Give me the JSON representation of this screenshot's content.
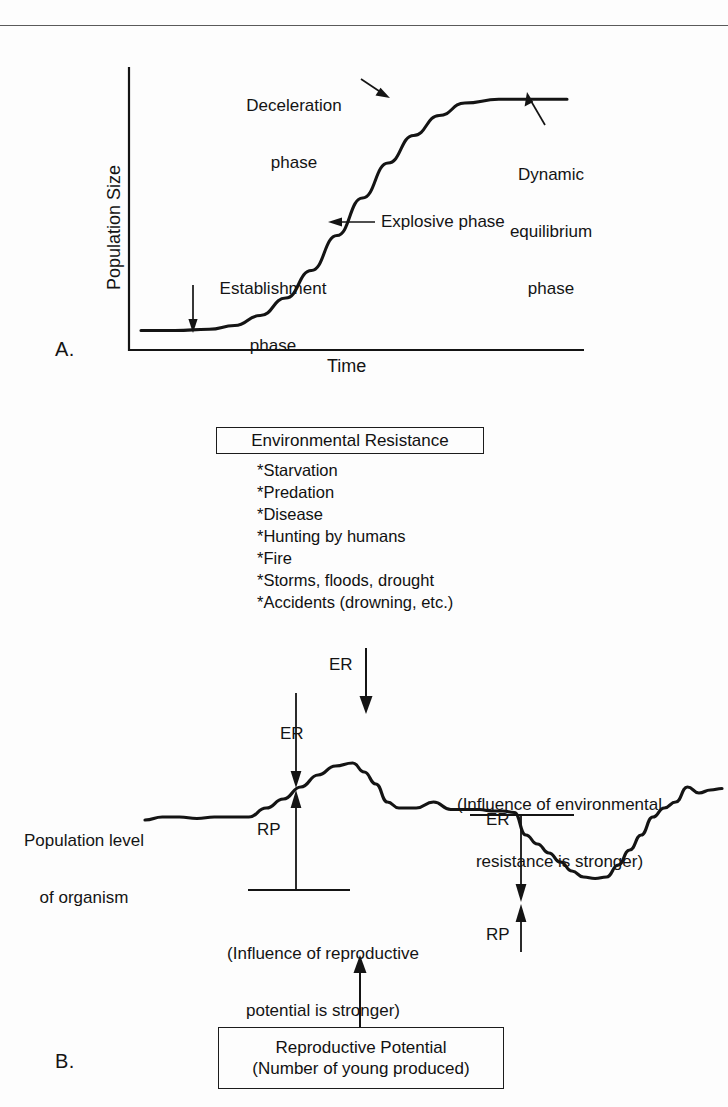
{
  "figure": {
    "panel_a_letter": "A.",
    "panel_b_letter": "B."
  },
  "chart_data": {
    "type": "line",
    "title": "",
    "panels": [
      {
        "id": "A",
        "type": "line",
        "xlabel": "Time",
        "ylabel": "Population Size",
        "description": "Sigmoid (logistic) population growth curve",
        "grid": false,
        "legend": "none",
        "xlim": [
          0,
          1
        ],
        "ylim": [
          0,
          1
        ],
        "annotations": [
          {
            "label": "Establishment phase",
            "x": 0.18,
            "y": 0.04
          },
          {
            "label": "Explosive phase",
            "x": 0.44,
            "y": 0.47
          },
          {
            "label": "Deceleration phase",
            "x": 0.64,
            "y": 0.86
          },
          {
            "label": "Dynamic equilibrium phase",
            "x": 0.9,
            "y": 0.96
          }
        ],
        "x": [
          0.0,
          0.08,
          0.16,
          0.22,
          0.28,
          0.34,
          0.4,
          0.46,
          0.52,
          0.58,
          0.64,
          0.7,
          0.76,
          0.84,
          0.92,
          1.0
        ],
        "y": [
          0.03,
          0.03,
          0.035,
          0.05,
          0.09,
          0.16,
          0.27,
          0.41,
          0.56,
          0.7,
          0.81,
          0.89,
          0.94,
          0.955,
          0.955,
          0.955
        ]
      },
      {
        "id": "B",
        "type": "line",
        "xlabel": "",
        "ylabel": "Population level of organism",
        "description": "Fluctuating population level showing balance between reproductive potential and environmental resistance",
        "grid": false,
        "legend": "none",
        "x": [
          0.0,
          0.03,
          0.06,
          0.09,
          0.12,
          0.15,
          0.18,
          0.21,
          0.24,
          0.27,
          0.3,
          0.33,
          0.36,
          0.38,
          0.4,
          0.42,
          0.44,
          0.47,
          0.5,
          0.53,
          0.56,
          0.58,
          0.6,
          0.62,
          0.64,
          0.66,
          0.68,
          0.7,
          0.72,
          0.74,
          0.76,
          0.78,
          0.8,
          0.82,
          0.84,
          0.86,
          0.88,
          0.9,
          0.92,
          0.94,
          0.96,
          0.98,
          1.0
        ],
        "y": [
          0.5,
          0.52,
          0.52,
          0.51,
          0.52,
          0.52,
          0.52,
          0.58,
          0.64,
          0.72,
          0.8,
          0.86,
          0.88,
          0.82,
          0.74,
          0.62,
          0.58,
          0.58,
          0.62,
          0.57,
          0.57,
          0.57,
          0.56,
          0.56,
          0.55,
          0.4,
          0.34,
          0.28,
          0.22,
          0.16,
          0.12,
          0.11,
          0.12,
          0.2,
          0.3,
          0.4,
          0.52,
          0.58,
          0.62,
          0.72,
          0.68,
          0.7,
          0.71
        ]
      }
    ]
  },
  "panel_a": {
    "y_axis_label": "Population Size",
    "x_axis_label": "Time",
    "annotations": {
      "establishment": "Establishment\nphase",
      "establishment_line1": "Establishment",
      "establishment_line2": "phase",
      "explosive": "Explosive phase",
      "deceleration_line1": "Deceleration",
      "deceleration_line2": "phase",
      "dynamic_line1": "Dynamic",
      "dynamic_line2": "equilibrium",
      "dynamic_line3": "phase"
    }
  },
  "environmental_resistance": {
    "box_title": "Environmental Resistance",
    "items": [
      "*Starvation",
      "*Predation",
      "*Disease",
      "*Hunting by humans",
      "*Fire",
      "*Storms, floods, drought",
      "*Accidents (drowning, etc.)"
    ],
    "arrow_label": "ER"
  },
  "reproductive_potential": {
    "box_line1": "Reproductive Potential",
    "box_line2": "(Number of young produced)"
  },
  "panel_b": {
    "y_axis_label_line1": "Population level",
    "y_axis_label_line2": "of organism",
    "peak": {
      "er_label": "ER",
      "rp_label": "RP",
      "caption_line1": "(Influence of reproductive",
      "caption_line2": "potential is stronger)"
    },
    "trough": {
      "er_label": "ER",
      "rp_label": "RP",
      "caption_line1": "(Influence of environmental",
      "caption_line2": "resistance is stronger)"
    }
  },
  "colors": {
    "ink": "#141414",
    "rule": "#5a5a5a",
    "background": "#fdfdfd"
  }
}
